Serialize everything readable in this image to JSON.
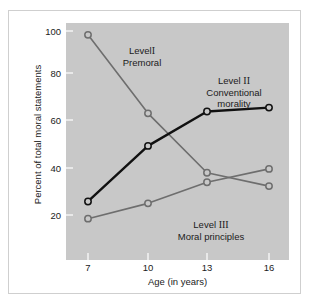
{
  "figure": {
    "background": "#ffffff",
    "plot_background": "#c8c8c8",
    "frame_color": "#cfcfcf"
  },
  "axes": {
    "y_title": "Percent of total moral statements",
    "x_title": "Age (in years)",
    "y_ticks": [
      "100",
      "80",
      "60",
      "40",
      "20"
    ],
    "x_ticks": [
      "7",
      "10",
      "13",
      "16"
    ]
  },
  "annotations": [
    {
      "id": "level-1",
      "line1": "Level",
      "numeral": "I",
      "line2": "Premoral"
    },
    {
      "id": "level-2",
      "line1": "Level",
      "numeral": "II",
      "line2": "Conventional",
      "line3": "morality"
    },
    {
      "id": "level-3",
      "line1": "Level",
      "numeral": "III",
      "line2": "Moral principles"
    }
  ],
  "chart_data": {
    "type": "line",
    "title": "",
    "xlabel": "Age (in years)",
    "ylabel": "Percent of total moral statements",
    "x": [
      7,
      10,
      13,
      16
    ],
    "xlim": [
      6,
      17
    ],
    "ylim": [
      0,
      100
    ],
    "ytick_values": [
      100,
      80,
      60,
      40,
      20
    ],
    "grid": false,
    "legend_position": "inline-annotations",
    "markers": "open-circle",
    "series": [
      {
        "name": "Level I Premoral",
        "color": "#6e6e6e",
        "linewidth": 1.6,
        "values": [
          98,
          57,
          26,
          19
        ]
      },
      {
        "name": "Level II Conventional morality",
        "color": "#111111",
        "linewidth": 2.4,
        "values": [
          11,
          40,
          58,
          60
        ]
      },
      {
        "name": "Level III Moral principles",
        "color": "#6e6e6e",
        "linewidth": 1.6,
        "values": [
          2,
          10,
          21,
          28
        ]
      }
    ]
  }
}
